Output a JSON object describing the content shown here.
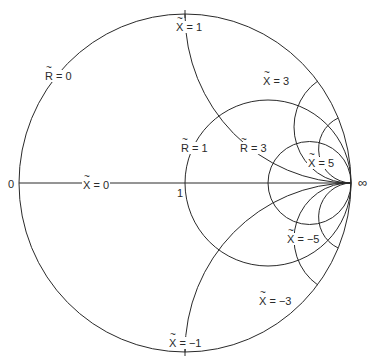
{
  "diagram": {
    "type": "smith-chart",
    "axis_labels": {
      "left": "0",
      "center": "1",
      "right": "∞"
    },
    "resistance_circles": [
      {
        "symbol": "R",
        "value": "0",
        "text": "= 0"
      },
      {
        "symbol": "R",
        "value": "1",
        "text": "= 1"
      },
      {
        "symbol": "R",
        "value": "3",
        "text": "= 3"
      }
    ],
    "reactance_arcs": [
      {
        "symbol": "X",
        "value": "0",
        "text": "= 0"
      },
      {
        "symbol": "X",
        "value": "1",
        "text": "= 1"
      },
      {
        "symbol": "X",
        "value": "3",
        "text": "= 3"
      },
      {
        "symbol": "X",
        "value": "5",
        "text": "= 5"
      },
      {
        "symbol": "X",
        "value": "-1",
        "text": "= −1"
      },
      {
        "symbol": "X",
        "value": "-3",
        "text": "= −3"
      },
      {
        "symbol": "X",
        "value": "-5",
        "text": "= −5"
      }
    ],
    "line_color": "#2a2a2a"
  }
}
